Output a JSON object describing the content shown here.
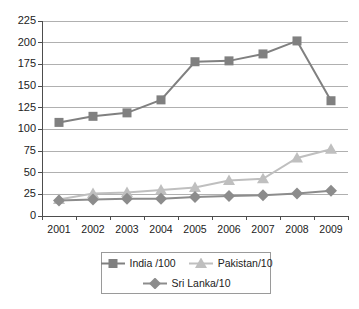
{
  "chart_data": {
    "type": "line",
    "title": "",
    "xlabel": "",
    "ylabel": "",
    "categories": [
      "2001",
      "2002",
      "2003",
      "2004",
      "2005",
      "2006",
      "2007",
      "2008",
      "2009"
    ],
    "ylim": [
      0,
      225
    ],
    "ytick_values": [
      0,
      25,
      50,
      75,
      100,
      125,
      150,
      175,
      200,
      225
    ],
    "ytick_labels": [
      "0",
      "25",
      "50",
      "75",
      "100",
      "125",
      "150",
      "175",
      "200",
      "225"
    ],
    "grid": true,
    "legend_position": "bottom",
    "series": [
      {
        "name": "India /100",
        "marker": "square",
        "color": "#808080",
        "values": [
          108,
          115,
          119,
          134,
          178,
          179,
          187,
          202,
          133
        ]
      },
      {
        "name": "Pakistan/10",
        "marker": "triangle",
        "color": "#bfbfbf",
        "values": [
          19,
          26,
          27,
          30,
          33,
          41,
          43,
          67,
          77
        ]
      },
      {
        "name": "Sri Lanka/10",
        "marker": "diamond",
        "color": "#8c8c8c",
        "values": [
          18,
          19,
          20,
          20,
          22,
          23,
          24,
          26,
          29
        ]
      }
    ]
  },
  "axis": {
    "line_color": "#4d4d4d",
    "grid_color": "#b0b0b0"
  },
  "legend": {
    "rows": [
      [
        "India /100",
        "Pakistan/10"
      ],
      [
        "Sri Lanka/10"
      ]
    ],
    "entries": [
      {
        "label": "India /100",
        "marker": "square",
        "color": "#808080"
      },
      {
        "label": "Pakistan/10",
        "marker": "triangle",
        "color": "#bfbfbf"
      },
      {
        "label": "Sri Lanka/10",
        "marker": "diamond",
        "color": "#8c8c8c"
      }
    ]
  }
}
